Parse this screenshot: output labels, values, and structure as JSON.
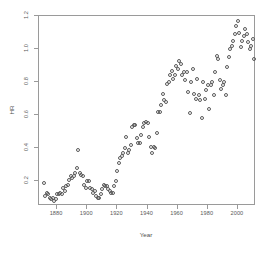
{
  "chart_data": {
    "type": "scatter",
    "title": "",
    "xlabel": "Year",
    "ylabel": "HR",
    "xlim": [
      1868,
      2012
    ],
    "ylim": [
      0.05,
      1.2
    ],
    "grid": false,
    "legend": null,
    "marker": {
      "shape": "open-circle",
      "color": "#5a5a5a",
      "size": 4
    },
    "xticks": [
      1880,
      1900,
      1920,
      1940,
      1960,
      1980,
      2000
    ],
    "xtick_labels": [
      "1880",
      "1900",
      "1920",
      "1940",
      "1960",
      "1980",
      "2000"
    ],
    "yticks": [
      0.2,
      0.4,
      0.6,
      0.8,
      1.0,
      1.2
    ],
    "ytick_labels": [
      "0.2",
      "0.4",
      "0.6",
      "0.8",
      "1.0",
      "1.2"
    ],
    "series": [
      {
        "name": "HR",
        "points": [
          [
            1871,
            0.19
          ],
          [
            1872,
            0.11
          ],
          [
            1873,
            0.13
          ],
          [
            1874,
            0.12
          ],
          [
            1875,
            0.1
          ],
          [
            1876,
            0.09
          ],
          [
            1877,
            0.1
          ],
          [
            1878,
            0.08
          ],
          [
            1879,
            0.09
          ],
          [
            1880,
            0.12
          ],
          [
            1881,
            0.12
          ],
          [
            1882,
            0.13
          ],
          [
            1883,
            0.12
          ],
          [
            1884,
            0.16
          ],
          [
            1885,
            0.14
          ],
          [
            1886,
            0.17
          ],
          [
            1887,
            0.18
          ],
          [
            1888,
            0.21
          ],
          [
            1889,
            0.23
          ],
          [
            1890,
            0.22
          ],
          [
            1891,
            0.23
          ],
          [
            1892,
            0.25
          ],
          [
            1893,
            0.28
          ],
          [
            1894,
            0.39
          ],
          [
            1895,
            0.25
          ],
          [
            1896,
            0.24
          ],
          [
            1897,
            0.23
          ],
          [
            1898,
            0.18
          ],
          [
            1899,
            0.16
          ],
          [
            1900,
            0.2
          ],
          [
            1901,
            0.2
          ],
          [
            1902,
            0.16
          ],
          [
            1903,
            0.15
          ],
          [
            1904,
            0.13
          ],
          [
            1905,
            0.14
          ],
          [
            1906,
            0.11
          ],
          [
            1907,
            0.1
          ],
          [
            1908,
            0.1
          ],
          [
            1909,
            0.12
          ],
          [
            1910,
            0.15
          ],
          [
            1911,
            0.18
          ],
          [
            1912,
            0.17
          ],
          [
            1913,
            0.17
          ],
          [
            1914,
            0.15
          ],
          [
            1915,
            0.14
          ],
          [
            1916,
            0.13
          ],
          [
            1917,
            0.13
          ],
          [
            1918,
            0.17
          ],
          [
            1919,
            0.2
          ],
          [
            1920,
            0.26
          ],
          [
            1921,
            0.31
          ],
          [
            1922,
            0.34
          ],
          [
            1923,
            0.35
          ],
          [
            1924,
            0.37
          ],
          [
            1925,
            0.4
          ],
          [
            1926,
            0.47
          ],
          [
            1927,
            0.37
          ],
          [
            1928,
            0.39
          ],
          [
            1929,
            0.42
          ],
          [
            1930,
            0.53
          ],
          [
            1931,
            0.54
          ],
          [
            1932,
            0.54
          ],
          [
            1933,
            0.46
          ],
          [
            1934,
            0.43
          ],
          [
            1935,
            0.43
          ],
          [
            1936,
            0.48
          ],
          [
            1937,
            0.53
          ],
          [
            1938,
            0.55
          ],
          [
            1939,
            0.56
          ],
          [
            1940,
            0.55
          ],
          [
            1941,
            0.47
          ],
          [
            1942,
            0.41
          ],
          [
            1943,
            0.37
          ],
          [
            1944,
            0.41
          ],
          [
            1945,
            0.4
          ],
          [
            1946,
            0.49
          ],
          [
            1947,
            0.62
          ],
          [
            1948,
            0.62
          ],
          [
            1949,
            0.66
          ],
          [
            1950,
            0.73
          ],
          [
            1951,
            0.69
          ],
          [
            1952,
            0.68
          ],
          [
            1953,
            0.79
          ],
          [
            1954,
            0.8
          ],
          [
            1955,
            0.84
          ],
          [
            1956,
            0.87
          ],
          [
            1957,
            0.82
          ],
          [
            1958,
            0.84
          ],
          [
            1959,
            0.9
          ],
          [
            1960,
            0.88
          ],
          [
            1961,
            0.93
          ],
          [
            1962,
            0.91
          ],
          [
            1963,
            0.84
          ],
          [
            1964,
            0.86
          ],
          [
            1965,
            0.81
          ],
          [
            1966,
            0.86
          ],
          [
            1967,
            0.74
          ],
          [
            1968,
            0.61
          ],
          [
            1969,
            0.8
          ],
          [
            1970,
            0.88
          ],
          [
            1971,
            0.73
          ],
          [
            1972,
            0.7
          ],
          [
            1973,
            0.82
          ],
          [
            1974,
            0.72
          ],
          [
            1975,
            0.69
          ],
          [
            1976,
            0.58
          ],
          [
            1977,
            0.8
          ],
          [
            1978,
            0.7
          ],
          [
            1979,
            0.75
          ],
          [
            1980,
            0.78
          ],
          [
            1981,
            0.64
          ],
          [
            1982,
            0.78
          ],
          [
            1983,
            0.8
          ],
          [
            1984,
            0.72
          ],
          [
            1985,
            0.86
          ],
          [
            1986,
            0.96
          ],
          [
            1987,
            0.94
          ],
          [
            1988,
            0.81
          ],
          [
            1989,
            0.76
          ],
          [
            1990,
            0.78
          ],
          [
            1991,
            0.8
          ],
          [
            1992,
            0.72
          ],
          [
            1993,
            0.89
          ],
          [
            1994,
            0.95
          ],
          [
            1995,
            1.0
          ],
          [
            1996,
            1.02
          ],
          [
            1997,
            1.05
          ],
          [
            1998,
            1.09
          ],
          [
            1999,
            1.14
          ],
          [
            2000,
            1.17
          ],
          [
            2001,
            1.1
          ],
          [
            2002,
            1.01
          ],
          [
            2003,
            1.05
          ],
          [
            2004,
            1.08
          ],
          [
            2005,
            1.12
          ],
          [
            2006,
            1.09
          ],
          [
            2007,
            1.04
          ],
          [
            2008,
            1.0
          ],
          [
            2009,
            1.02
          ],
          [
            2010,
            1.06
          ],
          [
            2011,
            0.94
          ]
        ]
      }
    ]
  }
}
